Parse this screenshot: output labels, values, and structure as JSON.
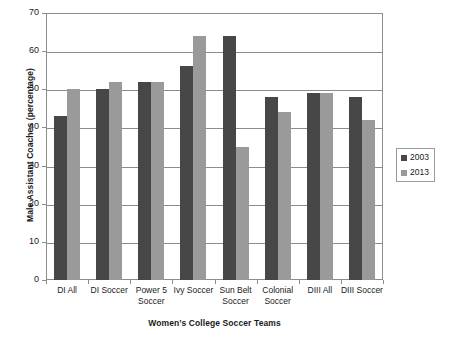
{
  "chart_data": {
    "type": "bar",
    "title": "",
    "xlabel": "Women’s College Soccer Teams",
    "ylabel": "Male Assistant Coaches (percentage)",
    "categories": [
      "DI All",
      "DI Soccer",
      "Power 5 Soccer",
      "Ivy Soccer",
      "Sun Belt Soccer",
      "Colonial Soccer",
      "DIII All",
      "DIII Soccer"
    ],
    "series": [
      {
        "name": "2003",
        "color": "#474747",
        "values": [
          43,
          50,
          52,
          56,
          64,
          48,
          49,
          48
        ]
      },
      {
        "name": "2013",
        "color": "#9a9a9a",
        "values": [
          50,
          52,
          52,
          64,
          35,
          44,
          49,
          42
        ]
      }
    ],
    "ylim": [
      0,
      70
    ],
    "yticks": [
      0,
      10,
      20,
      30,
      40,
      50,
      60,
      70
    ],
    "ytick_labels": [
      "0",
      "10",
      "20",
      "30",
      "40",
      "50",
      "60",
      "70"
    ],
    "grid": true,
    "legend_position": "right"
  },
  "axes": {
    "y_title": "Male Assistant Coaches (percentage)",
    "x_title": "Women’s College Soccer Teams"
  },
  "legend": {
    "items": [
      {
        "label": "2003",
        "color": "#474747"
      },
      {
        "label": "2013",
        "color": "#9a9a9a"
      }
    ]
  }
}
